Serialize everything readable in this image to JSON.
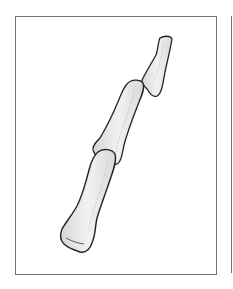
{
  "figure": {
    "panels": [
      {
        "id": "left-panel",
        "content": "proximal, middle and distal phalanx"
      },
      {
        "id": "right-panel",
        "content": "partially visible frame edge"
      }
    ],
    "colors": {
      "frame": "#6f6f6f",
      "bone_fill": "#e9e9e9",
      "bone_outline": "#222222",
      "stipple": "#9a9a9a",
      "background": "#ffffff"
    }
  }
}
